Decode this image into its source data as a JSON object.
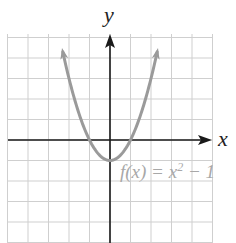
{
  "chart_data": {
    "type": "line",
    "title": "",
    "xlabel": "x",
    "ylabel": "y",
    "grid": true,
    "xlim": [
      -5,
      5
    ],
    "ylim": [
      -5,
      5
    ],
    "series": [
      {
        "name": "f(x) = x^2 - 1",
        "x": [
          -2.3,
          -2,
          -1.5,
          -1,
          -0.5,
          0,
          0.5,
          1,
          1.5,
          2,
          2.3
        ],
        "values": [
          4.29,
          3,
          1.25,
          0,
          -0.75,
          -1,
          -0.75,
          0,
          1.25,
          3,
          4.29
        ]
      }
    ],
    "annotations": [
      {
        "text": "f(x) = x² − 1",
        "position": "right of vertex"
      }
    ]
  },
  "labels": {
    "x_axis": "x",
    "y_axis": "y",
    "function_prefix": "f(x) = x",
    "function_exp": "2",
    "function_suffix": " − 1"
  },
  "colors": {
    "curve": "#9a9a9a",
    "axis": "#1a1a1a",
    "grid": "#cfcfcf",
    "label": "#a8a8a8"
  }
}
